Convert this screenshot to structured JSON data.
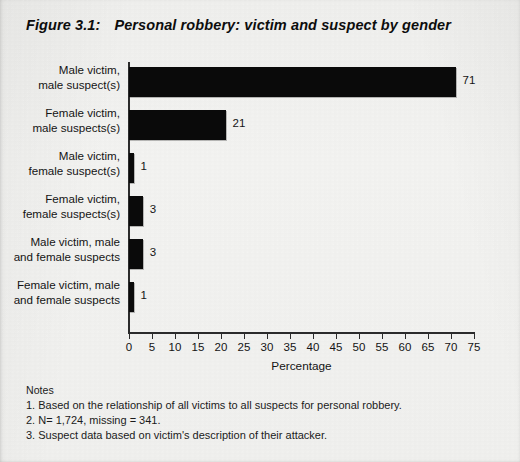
{
  "figure": {
    "number": "Figure 3.1:",
    "title": "Personal robbery: victim and suspect by gender"
  },
  "chart_data": {
    "type": "bar",
    "orientation": "horizontal",
    "title": "Personal robbery: victim and suspect by gender",
    "xlabel": "Percentage",
    "ylabel": "",
    "xlim": [
      0,
      75
    ],
    "xticks": [
      0,
      5,
      10,
      15,
      20,
      25,
      30,
      35,
      40,
      45,
      50,
      55,
      60,
      65,
      70,
      75
    ],
    "xtick_labels": [
      "0",
      "5",
      "10",
      "15",
      "20",
      "25",
      "30",
      "35",
      "40",
      "45",
      "50",
      "55",
      "60",
      "65",
      "70",
      "75"
    ],
    "grid": false,
    "legend": false,
    "bar_color": "#0a0a0a",
    "categories": [
      "Male victim,\nmale suspect(s)",
      "Female victim,\nmale suspects(s)",
      "Male victim,\nfemale suspect(s)",
      "Female victim,\nfemale suspects(s)",
      "Male victim, male\nand female suspects",
      "Female victim, male\nand female suspects"
    ],
    "values": [
      71,
      21,
      1,
      3,
      3,
      1
    ],
    "data_labels": [
      "71",
      "21",
      "1",
      "3",
      "3",
      "1"
    ]
  },
  "notes": {
    "heading": "Notes",
    "items": [
      "1. Based on the relationship of all victims to all suspects for personal robbery.",
      "2. N= 1,724, missing = 341.",
      "3. Suspect data based on victim's description of their attacker."
    ]
  }
}
